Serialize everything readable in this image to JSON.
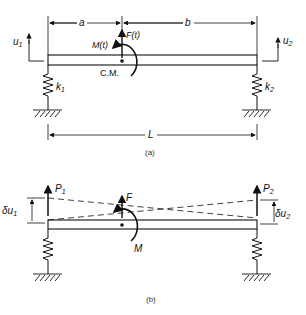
{
  "figure_a": {
    "caption": "(a)",
    "dim_a": "a",
    "dim_b": "b",
    "dim_L": "L",
    "force": "F(t)",
    "moment": "M(t)",
    "center_of_mass": "C.M.",
    "u1": "u",
    "u1_sub": "1",
    "u2": "u",
    "u2_sub": "2",
    "k1": "k",
    "k1_sub": "1",
    "k2": "k",
    "k2_sub": "2"
  },
  "figure_b": {
    "caption": "(b)",
    "p1": "P",
    "p1_sub": "1",
    "p2": "P",
    "p2_sub": "2",
    "force": "F",
    "moment": "M",
    "du1": "δu",
    "du1_sub": "1",
    "du2": "δu",
    "du2_sub": "2"
  }
}
